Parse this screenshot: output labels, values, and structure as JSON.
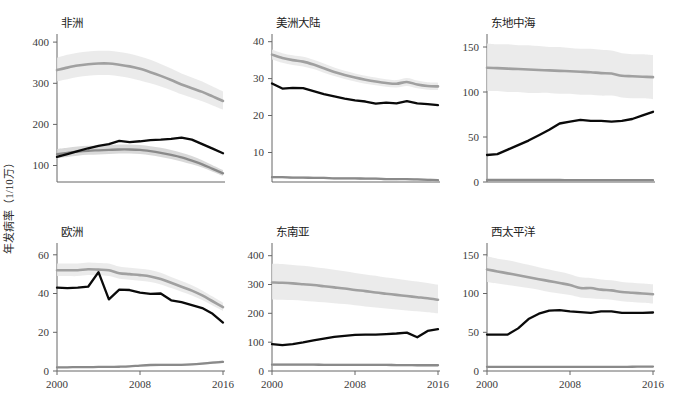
{
  "figure": {
    "ylabel": "年发病率（1/10万）",
    "xlabel": "",
    "xticks": [
      "2000",
      "2008",
      "2016"
    ],
    "colors": {
      "incidence_line": "#a0a0a0",
      "incidence_band": "#e8e8e8",
      "notification_line": "#0a0a0a",
      "mortality_line": "#8a8a8a",
      "mortality_band": "#cfcfcf",
      "axis": "#666666",
      "text": "#222222"
    }
  },
  "chart_data": {
    "type": "line",
    "title": "",
    "xlabel": "",
    "ylabel": "年发病率（1/10万）",
    "grid": false,
    "legend_position": "none",
    "x": [
      2000,
      2001,
      2002,
      2003,
      2004,
      2005,
      2006,
      2007,
      2008,
      2009,
      2010,
      2011,
      2012,
      2013,
      2014,
      2015,
      2016
    ],
    "panels": [
      {
        "title": "非洲",
        "ylim": [
          60,
          410
        ],
        "yticks": [
          100,
          200,
          300,
          400
        ],
        "series": [
          {
            "name": "incidence",
            "values": [
              332,
              338,
              343,
              346,
              348,
              348,
              345,
              341,
              335,
              327,
              318,
              308,
              297,
              288,
              279,
              268,
              257
            ],
            "lo": [
              305,
              310,
              315,
              318,
              320,
              320,
              317,
              313,
              307,
              300,
              292,
              283,
              273,
              265,
              256,
              246,
              236
            ],
            "hi": [
              362,
              369,
              374,
              377,
              379,
              379,
              376,
              372,
              365,
              357,
              347,
              336,
              324,
              314,
              304,
              292,
              280
            ]
          },
          {
            "name": "notification",
            "values": [
              121,
              128,
              135,
              142,
              148,
              152,
              160,
              157,
              159,
              162,
              163,
              165,
              168,
              163,
              152,
              141,
              130
            ],
            "lo": null,
            "hi": null
          },
          {
            "name": "mortality",
            "values": [
              128,
              131,
              134,
              136,
              137,
              138,
              139,
              139,
              138,
              135,
              131,
              126,
              120,
              112,
              103,
              92,
              81
            ],
            "lo": [
              118,
              121,
              124,
              126,
              127,
              128,
              129,
              129,
              128,
              125,
              121,
              116,
              110,
              103,
              95,
              85,
              75
            ],
            "hi": [
              140,
              143,
              146,
              148,
              149,
              150,
              151,
              151,
              150,
              147,
              143,
              138,
              131,
              123,
              113,
              101,
              89
            ]
          }
        ]
      },
      {
        "title": "美洲大陆",
        "ylim": [
          2,
          41
        ],
        "yticks": [
          10,
          20,
          30,
          40
        ],
        "series": [
          {
            "name": "incidence",
            "values": [
              36.5,
              35.6,
              35.0,
              34.6,
              33.8,
              32.8,
              31.8,
              31.0,
              30.3,
              29.7,
              29.2,
              28.8,
              28.6,
              29.1,
              28.4,
              28.0,
              27.9
            ],
            "lo": [
              35.2,
              34.3,
              33.7,
              33.3,
              32.6,
              31.6,
              30.7,
              29.9,
              29.2,
              28.6,
              28.2,
              27.8,
              27.6,
              28.0,
              27.4,
              27.0,
              26.9
            ],
            "hi": [
              37.9,
              36.9,
              36.3,
              35.9,
              35.1,
              34.1,
              33.0,
              32.1,
              31.4,
              30.8,
              30.3,
              29.8,
              29.6,
              30.2,
              29.5,
              29.0,
              28.9
            ]
          },
          {
            "name": "notification",
            "values": [
              28.7,
              27.3,
              27.5,
              27.4,
              26.6,
              25.8,
              25.2,
              24.6,
              24.1,
              23.8,
              23.2,
              23.5,
              23.3,
              23.9,
              23.3,
              23.1,
              22.8
            ],
            "lo": null,
            "hi": null
          },
          {
            "name": "mortality",
            "values": [
              3.3,
              3.3,
              3.2,
              3.2,
              3.1,
              3.1,
              3.0,
              3.0,
              3.0,
              2.9,
              2.9,
              2.8,
              2.8,
              2.8,
              2.7,
              2.6,
              2.5
            ],
            "lo": [
              3.0,
              3.0,
              2.9,
              2.9,
              2.8,
              2.8,
              2.7,
              2.7,
              2.7,
              2.6,
              2.6,
              2.5,
              2.5,
              2.5,
              2.4,
              2.3,
              2.2
            ],
            "hi": [
              3.6,
              3.6,
              3.5,
              3.5,
              3.4,
              3.4,
              3.3,
              3.3,
              3.3,
              3.2,
              3.2,
              3.1,
              3.1,
              3.1,
              3.0,
              2.9,
              2.8
            ]
          }
        ]
      },
      {
        "title": "东地中海",
        "ylim": [
          0,
          160
        ],
        "yticks": [
          0,
          50,
          100,
          150
        ],
        "series": [
          {
            "name": "incidence",
            "values": [
              127,
              126.5,
              126,
              125.5,
              125,
              124.5,
              124,
              123.5,
              123,
              122.5,
              122,
              121,
              120.5,
              118,
              117.5,
              117,
              116.5
            ],
            "lo": [
              101,
              101,
              100,
              100,
              99,
              99,
              99,
              98,
              98,
              97,
              97,
              96,
              96,
              94,
              93,
              93,
              92
            ],
            "hi": [
              154,
              153,
              153,
              152,
              152,
              151,
              150,
              150,
              149,
              148,
              148,
              147,
              146,
              143,
              142,
              142,
              141
            ]
          },
          {
            "name": "notification",
            "values": [
              30,
              31,
              36,
              41,
              46,
              52,
              58,
              65,
              67,
              69,
              68,
              68,
              67,
              68,
              70,
              74,
              78
            ],
            "lo": null,
            "hi": null
          },
          {
            "name": "mortality",
            "values": [
              2.2,
              2.2,
              2.2,
              2.2,
              2.2,
              2.2,
              2.2,
              2.2,
              2.1,
              2.1,
              2.1,
              2.1,
              2.1,
              2.0,
              2.0,
              2.0,
              2.0
            ],
            "lo": [
              1.6,
              1.6,
              1.6,
              1.6,
              1.6,
              1.6,
              1.6,
              1.6,
              1.5,
              1.5,
              1.5,
              1.5,
              1.5,
              1.5,
              1.4,
              1.4,
              1.4
            ],
            "hi": [
              2.9,
              2.9,
              2.9,
              2.9,
              2.9,
              2.9,
              2.9,
              2.8,
              2.8,
              2.8,
              2.8,
              2.8,
              2.7,
              2.7,
              2.6,
              2.6,
              2.6
            ]
          }
        ]
      },
      {
        "title": "欧洲",
        "ylim": [
          0,
          64
        ],
        "yticks": [
          0,
          20,
          40,
          60
        ],
        "series": [
          {
            "name": "incidence",
            "values": [
              52,
              52,
              52,
              52.5,
              52.3,
              52,
              50.5,
              50,
              49.5,
              48.8,
              47.5,
              45.5,
              43.5,
              41.5,
              39.0,
              36.0,
              33.0
            ],
            "lo": [
              49,
              49,
              49,
              49.5,
              49.3,
              49,
              47.6,
              47.1,
              46.6,
              46.0,
              44.7,
              42.8,
              40.9,
              39.0,
              36.6,
              33.8,
              31.0
            ],
            "hi": [
              55.5,
              55.5,
              55.5,
              56.0,
              55.8,
              55.5,
              53.9,
              53.3,
              52.8,
              52.1,
              50.7,
              48.5,
              46.4,
              44.2,
              41.6,
              38.4,
              35.2
            ]
          },
          {
            "name": "notification",
            "values": [
              43,
              42.8,
              43,
              43.5,
              51,
              37,
              42,
              41.8,
              40.5,
              39.8,
              40,
              36.5,
              35.5,
              34,
              32.5,
              29.5,
              25
            ],
            "lo": null,
            "hi": null
          },
          {
            "name": "mortality",
            "values": [
              1.9,
              1.9,
              2.0,
              2.0,
              2.1,
              2.1,
              2.2,
              2.4,
              2.8,
              3.1,
              3.2,
              3.2,
              3.2,
              3.4,
              3.8,
              4.3,
              4.7
            ],
            "lo": [
              1.6,
              1.6,
              1.7,
              1.7,
              1.8,
              1.8,
              1.9,
              2.1,
              2.4,
              2.7,
              2.8,
              2.8,
              2.8,
              3.0,
              3.3,
              3.8,
              4.1
            ],
            "hi": [
              2.3,
              2.3,
              2.4,
              2.4,
              2.5,
              2.5,
              2.6,
              2.8,
              3.2,
              3.6,
              3.7,
              3.7,
              3.7,
              3.9,
              4.4,
              4.9,
              5.4
            ]
          }
        ]
      },
      {
        "title": "东南亚",
        "ylim": [
          0,
          430
        ],
        "yticks": [
          0,
          100,
          200,
          300,
          400
        ],
        "series": [
          {
            "name": "incidence",
            "values": [
              307,
              306,
              304,
              301,
              298,
              294,
              290,
              286,
              281,
              277,
              272,
              268,
              264,
              260,
              256,
              252,
              247
            ],
            "lo": [
              248,
              247,
              246,
              244,
              241,
              238,
              235,
              232,
              228,
              224,
              220,
              217,
              213,
              210,
              207,
              204,
              200
            ],
            "hi": [
              372,
              371,
              368,
              365,
              361,
              356,
              351,
              346,
              340,
              335,
              330,
              324,
              320,
              315,
              310,
              305,
              299
            ]
          },
          {
            "name": "notification",
            "values": [
              93,
              90,
              93,
              99,
              106,
              112,
              118,
              122,
              125,
              126,
              126,
              128,
              130,
              133,
              117,
              139,
              145
            ],
            "lo": null,
            "hi": null
          },
          {
            "name": "mortality",
            "values": [
              22,
              22,
              22,
              22,
              22,
              21.5,
              21.5,
              21.5,
              21,
              21,
              21,
              21,
              20.5,
              20.5,
              20,
              20,
              20
            ],
            "lo": [
              18,
              18,
              18,
              18,
              18,
              17.6,
              17.6,
              17.6,
              17.2,
              17.2,
              17.2,
              17.2,
              16.8,
              16.8,
              16.4,
              16.4,
              16.4
            ],
            "hi": [
              26,
              26,
              26,
              26,
              26,
              25.5,
              25.5,
              25.5,
              25,
              25,
              25,
              25,
              24.5,
              24.5,
              24,
              24,
              24
            ]
          }
        ]
      },
      {
        "title": "西太平洋",
        "ylim": [
          0,
          160
        ],
        "yticks": [
          0,
          50,
          100,
          150
        ],
        "series": [
          {
            "name": "incidence",
            "values": [
              131,
              128.5,
              126,
              123.5,
              121,
              118.5,
              116,
              113.5,
              111,
              107,
              107,
              105,
              104,
              102,
              101,
              100,
              99
            ],
            "lo": [
              115,
              113,
              111,
              109,
              107,
              105,
              102,
              100,
              98,
              95,
              94,
              93,
              92,
              90,
              89,
              88,
              87
            ],
            "hi": [
              148,
              145,
              143,
              140,
              137,
              134,
              131,
              128,
              125,
              121,
              120,
              118,
              117,
              115,
              114,
              113,
              112
            ]
          },
          {
            "name": "notification",
            "values": [
              47,
              47,
              47,
              55,
              67,
              74,
              78,
              78.5,
              77,
              76,
              75,
              77,
              77,
              75,
              75,
              75,
              75.5
            ],
            "lo": null,
            "hi": null
          },
          {
            "name": "mortality",
            "values": [
              5.4,
              5.4,
              5.4,
              5.3,
              5.3,
              5.3,
              5.3,
              5.2,
              5.2,
              5.2,
              5.2,
              5.3,
              5.3,
              5.4,
              5.5,
              5.6,
              5.7
            ],
            "lo": [
              4.6,
              4.6,
              4.6,
              4.5,
              4.5,
              4.5,
              4.5,
              4.4,
              4.4,
              4.4,
              4.4,
              4.5,
              4.5,
              4.6,
              4.7,
              4.8,
              4.9
            ],
            "hi": [
              6.3,
              6.3,
              6.3,
              6.2,
              6.2,
              6.2,
              6.2,
              6.1,
              6.1,
              6.1,
              6.1,
              6.2,
              6.2,
              6.3,
              6.4,
              6.5,
              6.6
            ]
          }
        ]
      }
    ]
  }
}
